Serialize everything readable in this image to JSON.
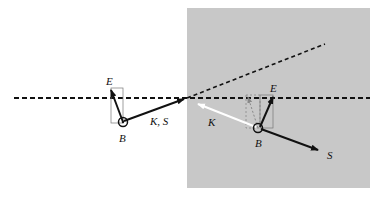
{
  "diagram": {
    "labels": {
      "incident_E": "E",
      "incident_B": "B",
      "incident_KS": "K, S",
      "medium_E": "E",
      "medium_B": "B",
      "medium_K": "K",
      "medium_S": "S"
    },
    "colors": {
      "medium_fill": "#c8c8c8",
      "line": "#111111",
      "k_vector_medium": "#ffffff"
    }
  }
}
